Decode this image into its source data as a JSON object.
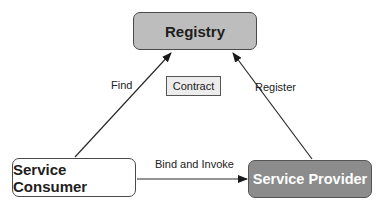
{
  "diagram": {
    "type": "service-oriented-architecture-triangle",
    "nodes": {
      "registry": {
        "label": "Registry",
        "fill": "#bdbdbd"
      },
      "consumer": {
        "label": "Service Consumer",
        "fill": "#ffffff"
      },
      "provider": {
        "label": "Service Provider",
        "fill": "#8c8c8c",
        "text_color": "#ffffff"
      },
      "contract": {
        "label": "Contract",
        "fill": "#ececec"
      }
    },
    "edges": [
      {
        "from": "Service Consumer",
        "to": "Registry",
        "label": "Find"
      },
      {
        "from": "Service Provider",
        "to": "Registry",
        "label": "Register"
      },
      {
        "from": "Service Consumer",
        "to": "Service Provider",
        "label": "Bind and Invoke"
      }
    ],
    "edge_labels": {
      "find": "Find",
      "register": "Register",
      "bind": "Bind and Invoke"
    },
    "colors": {
      "line": "#2a2a2a",
      "border": "#4a4a4a"
    }
  }
}
